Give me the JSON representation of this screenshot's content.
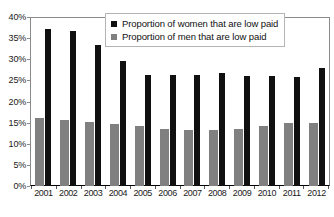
{
  "chart_data": {
    "type": "bar",
    "title": "",
    "xlabel": "",
    "ylabel": "",
    "ylim": [
      0,
      40
    ],
    "ytick_labels": [
      "40%",
      "35%",
      "30%",
      "25%",
      "20%",
      "15%",
      "10%",
      "5%",
      "0%"
    ],
    "ytick_values": [
      40,
      35,
      30,
      25,
      20,
      15,
      10,
      5,
      0
    ],
    "grid": false,
    "legend_position": "top-center",
    "categories": [
      "2001",
      "2002",
      "2003",
      "2004",
      "2005",
      "2006",
      "2007",
      "2008",
      "2009",
      "2010",
      "2011",
      "2012"
    ],
    "series": [
      {
        "name": "Proportion of women that are low paid",
        "color": "#101010",
        "values": [
          37.5,
          37.0,
          33.5,
          29.7,
          26.5,
          26.5,
          26.5,
          26.8,
          26.3,
          26.2,
          26.0,
          28.0
        ]
      },
      {
        "name": "Proportion of men that are low paid",
        "color": "#808080",
        "values": [
          16.3,
          15.7,
          15.2,
          14.7,
          14.2,
          13.5,
          13.3,
          13.4,
          13.6,
          14.3,
          15.0,
          15.1
        ]
      }
    ]
  },
  "legend": {
    "items": [
      {
        "label": "Proportion of women that are low paid",
        "swatch": "legend-swatch-women"
      },
      {
        "label": "Proportion of men that are low paid",
        "swatch": "legend-swatch-men"
      }
    ]
  }
}
